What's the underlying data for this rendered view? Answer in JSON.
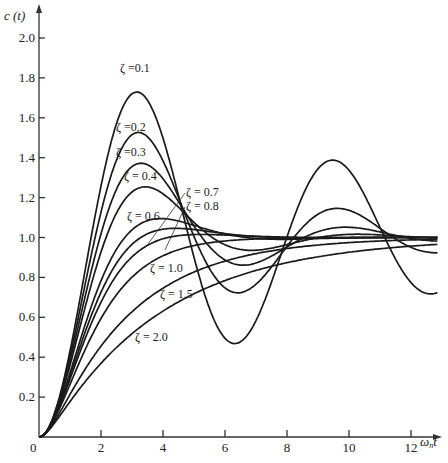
{
  "chart_data": {
    "type": "line",
    "title": "",
    "xlabel": "ωₙt",
    "ylabel": "c (t)",
    "xlim": [
      0,
      13.2
    ],
    "ylim": [
      0,
      2.1
    ],
    "grid": false,
    "legend": "inline labels",
    "x_ticks": [
      "0",
      "2",
      "4",
      "6",
      "8",
      "10",
      "12"
    ],
    "y_ticks": [
      "0.2",
      "0.4",
      "0.6",
      "0.8",
      "1.0",
      "1.2",
      "1.4",
      "1.6",
      "1.8",
      "2.0"
    ],
    "x": [
      0,
      1,
      2,
      3,
      4,
      5,
      6,
      7,
      8,
      9,
      10,
      11,
      12,
      13
    ],
    "series": [
      {
        "name": "ζ = 0.1",
        "zeta": 0.1,
        "values": [
          0,
          0.45,
          1.29,
          1.72,
          1.53,
          0.97,
          0.55,
          0.58,
          0.95,
          1.33,
          1.35,
          1.05,
          0.72,
          0.71
        ]
      },
      {
        "name": "ζ = 0.2",
        "zeta": 0.2,
        "values": [
          0,
          0.44,
          1.24,
          1.52,
          1.3,
          0.98,
          0.78,
          0.81,
          1.01,
          1.16,
          1.14,
          1.01,
          0.91,
          0.92
        ]
      },
      {
        "name": "ζ = 0.3",
        "zeta": 0.3,
        "values": [
          0,
          0.43,
          1.19,
          1.36,
          1.18,
          0.98,
          0.89,
          0.93,
          1.01,
          1.05,
          1.03,
          0.99,
          0.98,
          0.99
        ]
      },
      {
        "name": "ζ = 0.4",
        "zeta": 0.4,
        "values": [
          0,
          0.42,
          1.14,
          1.25,
          1.1,
          0.99,
          0.96,
          0.98,
          1.0,
          1.01,
          1.01,
          1.0,
          1.0,
          1.0
        ]
      },
      {
        "name": "ζ = 0.6",
        "zeta": 0.6,
        "values": [
          0,
          0.39,
          0.99,
          1.09,
          1.03,
          1.0,
          1.0,
          1.0,
          1.0,
          1.0,
          1.0,
          1.0,
          1.0,
          1.0
        ]
      },
      {
        "name": "ζ = 0.7",
        "zeta": 0.7,
        "values": [
          0,
          0.37,
          0.9,
          1.04,
          1.02,
          1.0,
          1.0,
          1.0,
          1.0,
          1.0,
          1.0,
          1.0,
          1.0,
          1.0
        ]
      },
      {
        "name": "ζ = 0.8",
        "zeta": 0.8,
        "values": [
          0,
          0.35,
          0.83,
          1.01,
          1.01,
          1.0,
          1.0,
          1.0,
          1.0,
          1.0,
          1.0,
          1.0,
          1.0,
          1.0
        ]
      },
      {
        "name": "ζ = 1.0",
        "zeta": 1.0,
        "values": [
          0,
          0.26,
          0.59,
          0.8,
          0.91,
          0.96,
          0.98,
          0.99,
          1.0,
          1.0,
          1.0,
          1.0,
          1.0,
          1.0
        ]
      },
      {
        "name": "ζ = 1.5",
        "zeta": 1.5,
        "values": [
          0,
          0.2,
          0.46,
          0.66,
          0.79,
          0.87,
          0.92,
          0.95,
          0.97,
          0.98,
          0.99,
          0.99,
          1.0,
          1.0
        ]
      },
      {
        "name": "ζ = 2.0",
        "zeta": 2.0,
        "values": [
          0,
          0.16,
          0.38,
          0.56,
          0.69,
          0.78,
          0.85,
          0.89,
          0.93,
          0.95,
          0.97,
          0.98,
          0.98,
          0.99
        ]
      }
    ],
    "annotations": [
      {
        "text": "ζ =0.1",
        "x": 120,
        "y": 72
      },
      {
        "text": "ζ =0.2",
        "x": 116,
        "y": 131
      },
      {
        "text": "ζ =0.3",
        "x": 116,
        "y": 156
      },
      {
        "text": "ζ = 0.4",
        "x": 124,
        "y": 180
      },
      {
        "text": "ζ = 0.6",
        "x": 127,
        "y": 220
      },
      {
        "text": "ζ = 0.7",
        "x": 186,
        "y": 196
      },
      {
        "text": "ζ = 0.8",
        "x": 186,
        "y": 210
      },
      {
        "text": "ζ = 1.0",
        "x": 150,
        "y": 272
      },
      {
        "text": "ζ = 1.5",
        "x": 160,
        "y": 298
      },
      {
        "text": "ζ = 2.0",
        "x": 135,
        "y": 341
      }
    ]
  },
  "axes": {
    "y_label": "c (t)",
    "x_label_main": "ω",
    "x_label_sub": "n",
    "x_label_tail": "t",
    "origin_label": "0"
  }
}
